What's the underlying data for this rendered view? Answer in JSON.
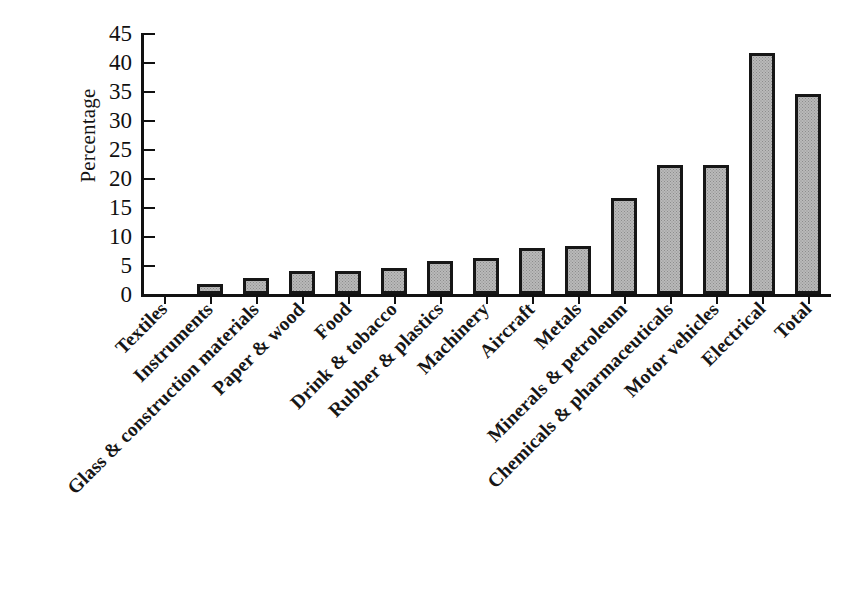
{
  "chart_data": {
    "type": "bar",
    "title": "",
    "subtitle": "",
    "xlabel": "",
    "ylabel": "Percentage",
    "ylim": [
      0,
      45
    ],
    "yticks": [
      0,
      5,
      10,
      15,
      20,
      25,
      30,
      35,
      40,
      45
    ],
    "grid": false,
    "legend": null,
    "bar_style": {
      "fill": "#b9b9b9",
      "pattern": "stippled-dots",
      "edge": "#161616",
      "edge_width_px": 3
    },
    "categories": [
      "Textiles",
      "Instruments",
      "Glass & construction materials",
      "Paper & wood",
      "Food",
      "Drink & tobacco",
      "Rubber & plastics",
      "Machinery",
      "Aircraft",
      "Metals",
      "Minerals & petroleum",
      "Chemicals & pharmaceuticals",
      "Motor vehicles",
      "Electrical",
      "Total"
    ],
    "values": [
      0,
      1.7,
      2.7,
      4.0,
      4.0,
      4.4,
      5.7,
      6.2,
      8.0,
      8.2,
      16.5,
      22.2,
      22.2,
      41.5,
      34.4
    ]
  }
}
